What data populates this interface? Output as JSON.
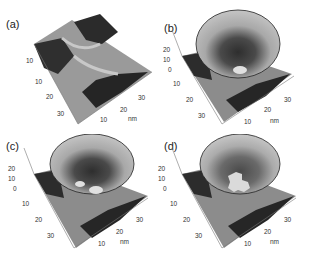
{
  "figure": {
    "panels": [
      {
        "id": "a",
        "label": "(a)",
        "description": "3D surface of cross-shaped groove (bare surface)",
        "y_ticks": [
          "10",
          "20",
          "30"
        ],
        "x_ticks": [
          "10",
          "20",
          "30"
        ],
        "z_ticks": [
          "10"
        ],
        "unit": "nm",
        "has_corral": false
      },
      {
        "id": "b",
        "label": "(b)",
        "description": "Conical corral with single small bright island at bottom",
        "z_ticks": [
          "20",
          "10",
          "0"
        ],
        "y_ticks": [
          "10",
          "20",
          "30"
        ],
        "x_ticks": [
          "10",
          "20",
          "30"
        ],
        "unit": "nm",
        "has_corral": true
      },
      {
        "id": "c",
        "label": "(c)",
        "description": "Conical corral with two bright islands at bottom",
        "z_ticks": [
          "20",
          "10",
          "0"
        ],
        "y_ticks": [
          "10",
          "20",
          "30"
        ],
        "x_ticks": [
          "10",
          "20",
          "30"
        ],
        "unit": "nm",
        "has_corral": true
      },
      {
        "id": "d",
        "label": "(d)",
        "description": "Conical corral with large irregular cross-shaped bright cluster at bottom",
        "z_ticks": [
          "20",
          "10",
          "0"
        ],
        "y_ticks": [
          "10",
          "20",
          "30"
        ],
        "x_ticks": [
          "10",
          "20",
          "30"
        ],
        "unit": "nm",
        "has_corral": true
      }
    ]
  },
  "colors": {
    "dark_surface": "#2a2a2a",
    "mid_surface": "#8a8a8a",
    "light_surface": "#c4c4c4",
    "corral_rim": "#b8b8b8",
    "corral_dark": "#3a3a3a",
    "island": "#d8d8d8"
  }
}
